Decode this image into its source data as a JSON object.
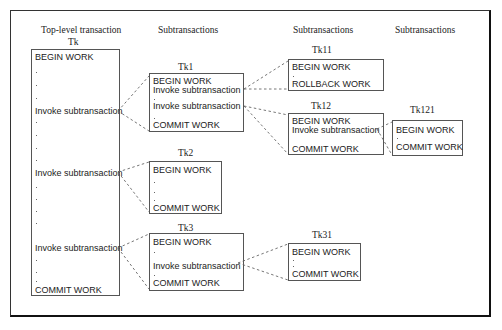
{
  "diagram": {
    "column_headers": [
      "Top-level transaction",
      "Subtransactions",
      "Subtransactions",
      "Subtransactions"
    ],
    "transactions": {
      "tk": {
        "label": "Tk",
        "lines": [
          "BEGIN WORK",
          "Invoke subtransaction",
          "Invoke subtransaction",
          "Invoke subtransaction",
          "COMMIT WORK"
        ]
      },
      "tk1": {
        "label": "Tk1",
        "lines": [
          "BEGIN WORK",
          "Invoke subtransaction",
          "Invoke subtransaction",
          "COMMIT WORK"
        ]
      },
      "tk2": {
        "label": "Tk2",
        "lines": [
          "BEGIN WORK",
          "COMMIT WORK"
        ]
      },
      "tk3": {
        "label": "Tk3",
        "lines": [
          "BEGIN WORK",
          "Invoke subtransaction",
          "COMMIT WORK"
        ]
      },
      "tk11": {
        "label": "Tk11",
        "lines": [
          "BEGIN WORK",
          "ROLLBACK WORK"
        ]
      },
      "tk12": {
        "label": "Tk12",
        "lines": [
          "BEGIN WORK",
          "Invoke subtransaction",
          "COMMIT WORK"
        ]
      },
      "tk121": {
        "label": "Tk121",
        "lines": [
          "BEGIN WORK",
          "COMMIT WORK"
        ]
      },
      "tk31": {
        "label": "Tk31",
        "lines": [
          "BEGIN WORK",
          "COMMIT WORK"
        ]
      }
    },
    "edges": [
      {
        "from": "Tk",
        "to": "Tk1"
      },
      {
        "from": "Tk",
        "to": "Tk2"
      },
      {
        "from": "Tk",
        "to": "Tk3"
      },
      {
        "from": "Tk1",
        "to": "Tk11"
      },
      {
        "from": "Tk1",
        "to": "Tk12"
      },
      {
        "from": "Tk12",
        "to": "Tk121"
      },
      {
        "from": "Tk3",
        "to": "Tk31"
      }
    ],
    "colors": {
      "line": "#555555",
      "text": "#222222",
      "frame": "#111111"
    }
  }
}
